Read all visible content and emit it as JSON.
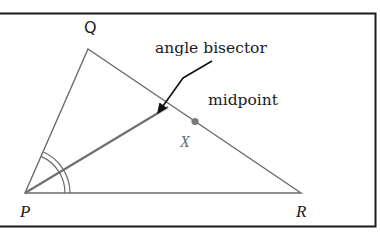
{
  "diagram": {
    "type": "geometry-triangle",
    "frame": {
      "stroke": "#1a1a1a"
    },
    "vertices": {
      "P": {
        "label": "P",
        "x": 25,
        "y": 193
      },
      "Q": {
        "label": "Q",
        "x": 88,
        "y": 49
      },
      "R": {
        "label": "R",
        "x": 301,
        "y": 193
      }
    },
    "labels": {
      "P": "P",
      "Q": "Q",
      "R": "R",
      "X": "X",
      "angle_bisector": "angle bisector",
      "midpoint": "midpoint"
    },
    "colors": {
      "triangle": "#6b6b6b",
      "bisector": "#707070",
      "arrow": "#111111",
      "midpoint_dot": "#7a7a7a",
      "text": "#1a1a1a"
    },
    "annotations": [
      {
        "text": "angle bisector",
        "points_to": "bisector line PX'"
      },
      {
        "text": "midpoint",
        "points_to": "midpoint of QR"
      }
    ],
    "angle_marks": {
      "vertex": "P",
      "count": 2,
      "style": "double arc"
    }
  }
}
